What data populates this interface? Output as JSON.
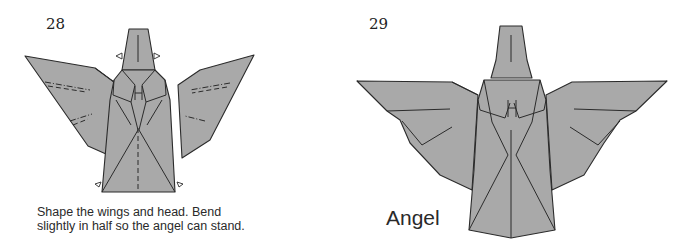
{
  "steps": [
    {
      "number": "28",
      "caption_line1": "Shape the wings and head. Bend",
      "caption_line2": "slightly in half so the angel can stand."
    },
    {
      "number": "29",
      "title": "Angel"
    }
  ],
  "colors": {
    "paper": "#a9a9a9",
    "line": "#2b2b2b",
    "background": "#ffffff"
  }
}
